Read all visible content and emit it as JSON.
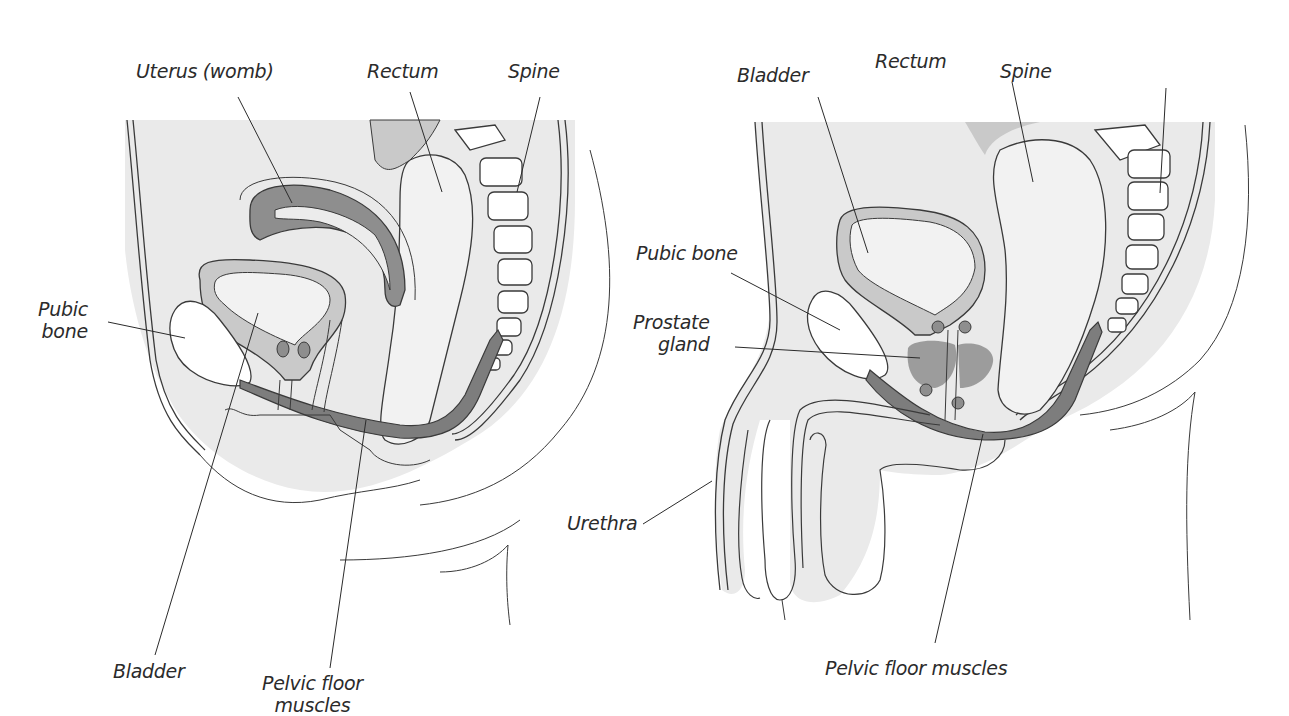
{
  "colors": {
    "body_fill": "#eaeaea",
    "wall_fill": "#c9c9c9",
    "organ_dark": "#8e8e8e",
    "muscle": "#7d7d7d",
    "bone": "#ffffff",
    "outline": "#3a3a3a",
    "leader": "#2b2b2b"
  },
  "female": {
    "labels": {
      "uterus": "Uterus (womb)",
      "rectum": "Rectum",
      "spine": "Spine",
      "pubic_bone_1": "Pubic",
      "pubic_bone_2": "bone",
      "bladder": "Bladder",
      "pelvic_floor_1": "Pelvic floor",
      "pelvic_floor_2": "muscles"
    }
  },
  "male": {
    "labels": {
      "bladder": "Bladder",
      "rectum": "Rectum",
      "spine": "Spine",
      "pubic_bone": "Pubic bone",
      "prostate_1": "Prostate",
      "prostate_2": "gland",
      "urethra": "Urethra",
      "pelvic_floor": "Pelvic floor muscles"
    }
  }
}
